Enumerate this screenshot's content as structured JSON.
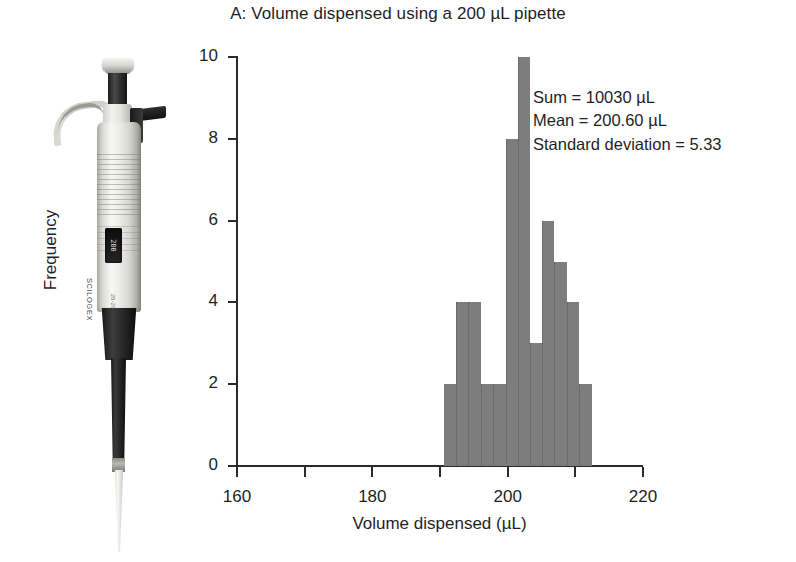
{
  "figure": {
    "title": "A: Volume dispensed using a 200 µL pipette"
  },
  "annotation": {
    "sum": "Sum = 10030 µL",
    "mean": "Mean = 200.60 µL",
    "sd": "Standard deviation = 5.33"
  },
  "photo": {
    "brand": "SCILOGEX",
    "model": "20-200µl",
    "digits": "200"
  },
  "chart_data": {
    "type": "bar",
    "title": "A: Volume dispensed using a 200 µL pipette",
    "xlabel": "Volume dispensed (µL)",
    "ylabel": "Frequency",
    "xlim": [
      160,
      220
    ],
    "ylim": [
      0,
      10
    ],
    "grid": false,
    "legend": null,
    "bin_width": 1.84,
    "bar_color": "#7d7d7d",
    "xticks": [
      160,
      170,
      180,
      190,
      200,
      210,
      220
    ],
    "xtick_labels": [
      "160",
      "",
      "180",
      "",
      "200",
      "",
      "220"
    ],
    "yticks": [
      0,
      2,
      4,
      6,
      8,
      10
    ],
    "ytick_labels": [
      "0",
      "2",
      "4",
      "6",
      "8",
      "10"
    ],
    "bins": [
      {
        "left": 190.6,
        "right": 192.4,
        "value": 2
      },
      {
        "left": 192.4,
        "right": 194.2,
        "value": 4
      },
      {
        "left": 194.2,
        "right": 196.0,
        "value": 4
      },
      {
        "left": 196.0,
        "right": 197.9,
        "value": 2
      },
      {
        "left": 197.9,
        "right": 199.7,
        "value": 2
      },
      {
        "left": 199.7,
        "right": 201.5,
        "value": 8
      },
      {
        "left": 201.5,
        "right": 203.3,
        "value": 10
      },
      {
        "left": 203.3,
        "right": 205.1,
        "value": 3
      },
      {
        "left": 205.1,
        "right": 206.9,
        "value": 6
      },
      {
        "left": 206.9,
        "right": 208.8,
        "value": 5
      },
      {
        "left": 208.8,
        "right": 210.6,
        "value": 4
      },
      {
        "left": 210.6,
        "right": 212.4,
        "value": 2
      }
    ],
    "categories": [
      "190.6",
      "192.4",
      "194.2",
      "196.0",
      "197.9",
      "199.7",
      "201.5",
      "203.3",
      "205.1",
      "206.9",
      "208.8",
      "210.6"
    ],
    "values": [
      2,
      4,
      4,
      2,
      2,
      8,
      10,
      3,
      6,
      5,
      4,
      2
    ],
    "statistics": {
      "sum": 10030,
      "sum_unit": "µL",
      "mean": 200.6,
      "mean_unit": "µL",
      "standard_deviation": 5.33
    }
  }
}
